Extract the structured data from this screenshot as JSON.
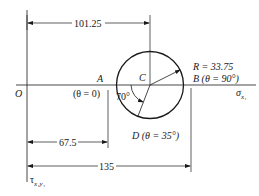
{
  "diagram": {
    "type": "mohr-circle",
    "origin_label": "O",
    "horizontal_axis_label": "σ",
    "horizontal_axis_subscript": "x₁",
    "vertical_axis_label": "τ",
    "vertical_axis_subscript": "x₁y₁",
    "center_label": "C",
    "radius_label": "R = 33.75",
    "points": {
      "A": {
        "name": "A",
        "theta": "(θ = 0)"
      },
      "B": {
        "name": "B",
        "theta": "(θ = 90°)",
        "full": "B (θ = 90°)"
      },
      "D": {
        "name": "D",
        "theta": "(θ = 35°)",
        "full": "D (θ = 35°)"
      }
    },
    "angle_label": "70°",
    "dimensions": {
      "to_center": "101.25",
      "to_A": "67.5",
      "to_B": "135"
    }
  }
}
